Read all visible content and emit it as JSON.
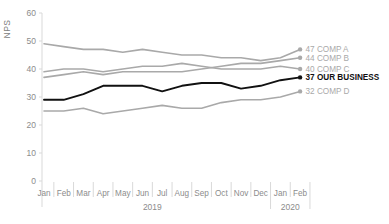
{
  "chart_data": {
    "type": "line",
    "title": "",
    "xlabel": "",
    "ylabel": "NPS",
    "ylim": [
      0,
      60
    ],
    "yticks": [
      0,
      10,
      20,
      30,
      40,
      50,
      60
    ],
    "grid": false,
    "legend_position": "right-end-labels",
    "categories": [
      "Jan",
      "Feb",
      "Mar",
      "Apr",
      "May",
      "Jun",
      "Jul",
      "Aug",
      "Sep",
      "Oct",
      "Nov",
      "Dec",
      "Jan",
      "Feb"
    ],
    "year_groups": [
      {
        "label": "2019",
        "start": 0,
        "end": 11
      },
      {
        "label": "2020",
        "start": 12,
        "end": 13
      }
    ],
    "series": [
      {
        "name": "COMP A",
        "end_label": "47 COMP A",
        "end_value": 47,
        "emphasis": false,
        "values": [
          49,
          48,
          47,
          47,
          46,
          47,
          46,
          45,
          45,
          44,
          44,
          43,
          44,
          47
        ]
      },
      {
        "name": "COMP B",
        "end_label": "44 COMP B",
        "end_value": 44,
        "emphasis": false,
        "values": [
          37,
          38,
          39,
          38,
          39,
          39,
          39,
          39,
          40,
          41,
          42,
          42,
          43,
          44
        ]
      },
      {
        "name": "COMP C",
        "end_label": "40 COMP C",
        "end_value": 40,
        "emphasis": false,
        "values": [
          39,
          40,
          40,
          39,
          40,
          41,
          41,
          42,
          41,
          40,
          40,
          40,
          41,
          40
        ]
      },
      {
        "name": "OUR BUSINESS",
        "end_label": "37 OUR BUSINESS",
        "end_value": 37,
        "emphasis": true,
        "values": [
          29,
          29,
          31,
          34,
          34,
          34,
          32,
          34,
          35,
          35,
          33,
          34,
          36,
          37
        ]
      },
      {
        "name": "COMP D",
        "end_label": "32 COMP D",
        "end_value": 32,
        "emphasis": false,
        "values": [
          25,
          25,
          26,
          24,
          25,
          26,
          27,
          26,
          26,
          28,
          29,
          29,
          30,
          32
        ]
      }
    ]
  },
  "colors": {
    "competitor_line": "#a9a9a9",
    "emphasis_line": "#111111",
    "axis": "#d9d9d9",
    "tick_text": "#8c8c8c",
    "ylabel_text": "#808080",
    "background": "#ffffff"
  }
}
